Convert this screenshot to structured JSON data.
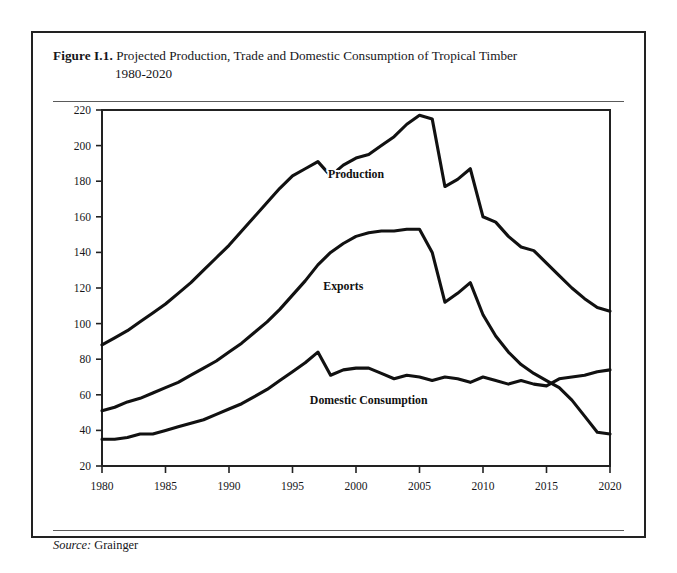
{
  "figure": {
    "label": "Figure I.1.",
    "title_line1": "Projected Production, Trade and Domestic Consumption of Tropical Timber",
    "title_line2": "1980-2020",
    "source_label": "Source:",
    "source_value": "Grainger"
  },
  "chart_data": {
    "type": "line",
    "title": "Projected Production, Trade and Domestic Consumption of Tropical Timber 1980-2020",
    "xlabel": "",
    "ylabel": "",
    "xlim": [
      1980,
      2020
    ],
    "ylim": [
      20,
      220
    ],
    "grid": false,
    "legend_position": "inline-labels",
    "xticks": [
      1980,
      1985,
      1990,
      1995,
      2000,
      2005,
      2010,
      2015,
      2020
    ],
    "yticks": [
      20,
      40,
      60,
      80,
      100,
      120,
      140,
      160,
      180,
      200,
      220
    ],
    "x": [
      1980,
      1981,
      1982,
      1983,
      1984,
      1985,
      1986,
      1987,
      1988,
      1989,
      1990,
      1991,
      1992,
      1993,
      1994,
      1995,
      1996,
      1997,
      1998,
      1999,
      2000,
      2001,
      2002,
      2003,
      2004,
      2005,
      2006,
      2007,
      2008,
      2009,
      2010,
      2011,
      2012,
      2013,
      2014,
      2015,
      2016,
      2017,
      2018,
      2019,
      2020
    ],
    "series": [
      {
        "name": "Production",
        "label": "Production",
        "label_x": 2000,
        "label_y": 184,
        "values": [
          88,
          92,
          96,
          101,
          106,
          111,
          117,
          123,
          130,
          137,
          144,
          152,
          160,
          168,
          176,
          183,
          187,
          191,
          183,
          189,
          193,
          195,
          200,
          205,
          212,
          217,
          215,
          177,
          181,
          187,
          160,
          157,
          149,
          143,
          141,
          134,
          127,
          120,
          114,
          109,
          107
        ]
      },
      {
        "name": "Exports",
        "label": "Exports",
        "label_x": 1999,
        "label_y": 121,
        "values": [
          51,
          53,
          56,
          58,
          61,
          64,
          67,
          71,
          75,
          79,
          84,
          89,
          95,
          101,
          108,
          116,
          124,
          133,
          140,
          145,
          149,
          151,
          152,
          152,
          153,
          153,
          140,
          112,
          117,
          123,
          105,
          93,
          84,
          77,
          72,
          68,
          64,
          57,
          48,
          39,
          38
        ]
      },
      {
        "name": "Domestic Consumption",
        "label": "Domestic Consumption",
        "label_x": 2001,
        "label_y": 57,
        "values": [
          35,
          35,
          36,
          38,
          38,
          40,
          42,
          44,
          46,
          49,
          52,
          55,
          59,
          63,
          68,
          73,
          78,
          84,
          71,
          74,
          75,
          75,
          72,
          69,
          71,
          70,
          68,
          70,
          69,
          67,
          70,
          68,
          66,
          68,
          66,
          65,
          69,
          70,
          71,
          73,
          74
        ]
      }
    ]
  },
  "axis": {
    "left_tick_labels": [
      "220",
      "200",
      "180",
      "160",
      "140",
      "120",
      "100",
      "80",
      "60",
      "40",
      "20"
    ],
    "bottom_tick_labels": [
      "1980",
      "1985",
      "1990",
      "1995",
      "2000",
      "2005",
      "2010",
      "2015",
      "2020"
    ]
  }
}
